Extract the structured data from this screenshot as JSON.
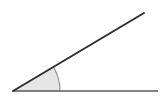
{
  "figure": {
    "kind": "geometry-angle-diagram",
    "title": "Acute angle formed by two rays",
    "background_color": "#ffffff",
    "width": 165,
    "height": 102,
    "vertex": {
      "label": "vertex",
      "x": 13,
      "y": 91
    },
    "rays": [
      {
        "name": "horizontal-ray",
        "label": "horizontal baseline ray",
        "from_x": 13,
        "from_y": 91,
        "to_x": 158,
        "to_y": 91,
        "color": "#5a5a5a",
        "stroke_width": 1.6
      },
      {
        "name": "diagonal-ray",
        "label": "upward slanting ray",
        "from_x": 13,
        "from_y": 91,
        "to_x": 144,
        "to_y": 13,
        "color": "#2f2f2f",
        "stroke_width": 2.0
      }
    ],
    "angle_marker": {
      "name": "angle-arc",
      "label": "angle arc sector",
      "radius": 47,
      "start_degrees": 0,
      "end_degrees": 31,
      "measure_degrees": 31,
      "fill_color": "#e6e6e6",
      "stroke_color": "#8a8a8a",
      "stroke_width": 1.1
    }
  }
}
